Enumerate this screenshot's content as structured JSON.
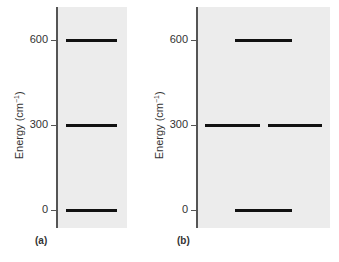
{
  "diagram": {
    "y_axis_label": "Energy (cm",
    "y_axis_label_sup": "−1",
    "y_axis_label_close": ")",
    "ticks": [
      "600",
      "300",
      "0"
    ],
    "panels": [
      {
        "tag": "(a)",
        "levels": [
          {
            "energy": 600,
            "degeneracy": 1
          },
          {
            "energy": 300,
            "degeneracy": 1
          },
          {
            "energy": 0,
            "degeneracy": 1
          }
        ]
      },
      {
        "tag": "(b)",
        "levels": [
          {
            "energy": 600,
            "degeneracy": 1
          },
          {
            "energy": 300,
            "degeneracy": 2
          },
          {
            "energy": 0,
            "degeneracy": 1
          }
        ]
      }
    ]
  }
}
